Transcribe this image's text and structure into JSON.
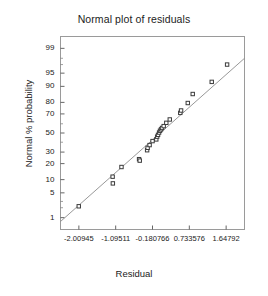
{
  "chart_data": {
    "type": "scatter",
    "title": "Normal plot of residuals",
    "xlabel": "Residual",
    "ylabel": "Normal % probability",
    "grid": false,
    "legend": null,
    "xlim": [
      -2.4655,
      2.1039
    ],
    "ylim_percent": [
      0.4,
      99.6
    ],
    "xticks": [
      -2.00945,
      -1.09511,
      -0.180766,
      0.733576,
      1.64792
    ],
    "xtick_labels": [
      "-2.00945",
      "-1.09511",
      "-0.180766",
      "0.733576",
      "1.64792"
    ],
    "yticks": [
      1,
      5,
      10,
      20,
      30,
      50,
      70,
      80,
      90,
      95,
      99
    ],
    "ytick_labels": [
      "1",
      "5",
      "10",
      "20",
      "30",
      "50",
      "70",
      "80",
      "90",
      "95",
      "99"
    ],
    "minor_yticks": [
      2,
      3,
      40,
      60,
      97,
      98
    ],
    "reference_line": {
      "x0": -2.4655,
      "y0_percent": 0.75,
      "x1": 2.1039,
      "y1_percent": 98.0,
      "color": "#8c8c8c"
    },
    "marker": {
      "shape": "square-open",
      "size": 3.4,
      "edge_color": "#3a3a3a",
      "face_color": "#ffffff"
    },
    "points": [
      {
        "x": -2.0123,
        "percent": 2.2
      },
      {
        "x": -1.1711,
        "percent": 11.5
      },
      {
        "x": -1.1655,
        "percent": 8.3
      },
      {
        "x": -0.9512,
        "percent": 17.5
      },
      {
        "x": -0.5142,
        "percent": 23.6
      },
      {
        "x": -0.4978,
        "percent": 22.4
      },
      {
        "x": -0.3144,
        "percent": 31.8
      },
      {
        "x": -0.302,
        "percent": 34.2
      },
      {
        "x": -0.253,
        "percent": 37.0
      },
      {
        "x": -0.18,
        "percent": 41.2
      },
      {
        "x": -0.087,
        "percent": 43.0
      },
      {
        "x": -0.065,
        "percent": 46.0
      },
      {
        "x": -0.043,
        "percent": 48.0
      },
      {
        "x": -0.017,
        "percent": 50.5
      },
      {
        "x": 0.006,
        "percent": 52.5
      },
      {
        "x": 0.031,
        "percent": 54.0
      },
      {
        "x": 0.056,
        "percent": 55.5
      },
      {
        "x": 0.097,
        "percent": 57.5
      },
      {
        "x": 0.162,
        "percent": 61.0
      },
      {
        "x": 0.248,
        "percent": 64.5
      },
      {
        "x": 0.509,
        "percent": 71.0
      },
      {
        "x": 0.529,
        "percent": 73.2
      },
      {
        "x": 0.695,
        "percent": 79.5
      },
      {
        "x": 0.818,
        "percent": 85.8
      },
      {
        "x": 1.29,
        "percent": 92.0
      },
      {
        "x": 1.672,
        "percent": 97.0
      }
    ]
  },
  "frame": {
    "border_color": "#9a9a9a",
    "background": "#ffffff"
  }
}
